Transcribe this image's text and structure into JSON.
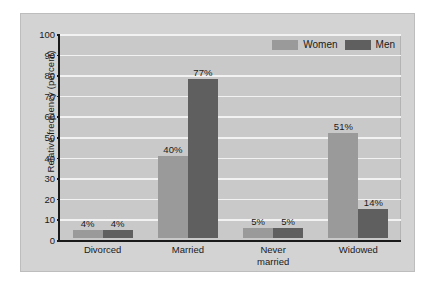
{
  "chart_data": {
    "type": "bar",
    "title": "",
    "xlabel": "",
    "ylabel": "Relative frequency (percent)",
    "categories": [
      "Divorced",
      "Married",
      "Never married",
      "Widowed"
    ],
    "category_lines": [
      [
        "Divorced"
      ],
      [
        "Married"
      ],
      [
        "Never",
        "married"
      ],
      [
        "Widowed"
      ]
    ],
    "series": [
      {
        "name": "Women",
        "color": "#9a9a9a",
        "values": [
          4,
          40,
          5,
          51
        ],
        "labels": [
          "4%",
          "40%",
          "5%",
          "51%"
        ]
      },
      {
        "name": "Men",
        "color": "#5f5f5f",
        "values": [
          4,
          77,
          5,
          14
        ],
        "labels": [
          "4%",
          "77%",
          "5%",
          "14%"
        ]
      }
    ],
    "ylim": [
      0,
      100
    ],
    "ytick_step": 10,
    "yticks": [
      "0",
      "10",
      "20",
      "30",
      "40",
      "50",
      "60",
      "70",
      "80",
      "90",
      "100"
    ],
    "grid": true,
    "legend_position": "top-right",
    "plot_background": "#c9c9c9",
    "figure_background": "#d3d3d3"
  }
}
